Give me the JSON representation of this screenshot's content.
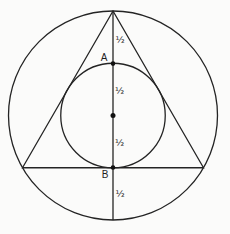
{
  "figure": {
    "kind": "geometry-diagram",
    "points": {
      "a": "A",
      "b": "B"
    },
    "segment_labels": [
      "½",
      "½",
      "½",
      "½"
    ],
    "colors": {
      "line": "#242424",
      "dot": "#111111",
      "background": "#fbfbfa"
    }
  }
}
